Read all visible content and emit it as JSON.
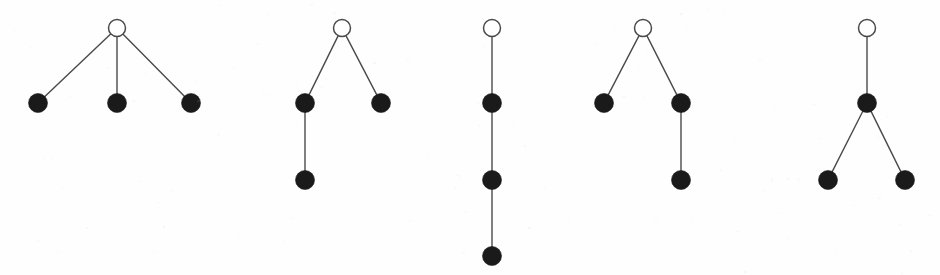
{
  "figure": {
    "background_color": "#fefefe",
    "width": 940,
    "height": 275,
    "node_styles": {
      "root_label": "open-circle",
      "root_fill": "#ffffff",
      "root_stroke": "#4a4a4a",
      "root_radius": 8.5,
      "child_label": "filled-circle",
      "child_fill": "#1a1a1a",
      "child_radius": 9.5,
      "edge_color": "#4a4a4a",
      "edge_width": 1.4
    }
  },
  "chart_data": {
    "type": "diagram",
    "diagram_kind": "rooted-tree-graphs",
    "xlabel": "",
    "ylabel": "",
    "grid": false,
    "legend": "none",
    "trees": [
      {
        "name": "tree-1",
        "description": "star: root with three leaf children",
        "nodes": [
          {
            "id": "r",
            "x": 117,
            "y": 28,
            "type": "open",
            "depth": 0
          },
          {
            "id": "a",
            "x": 38,
            "y": 103,
            "type": "filled",
            "depth": 1
          },
          {
            "id": "b",
            "x": 117,
            "y": 103,
            "type": "filled",
            "depth": 1
          },
          {
            "id": "c",
            "x": 191,
            "y": 103,
            "type": "filled",
            "depth": 1
          }
        ],
        "edges": [
          [
            "r",
            "a"
          ],
          [
            "r",
            "b"
          ],
          [
            "r",
            "c"
          ]
        ]
      },
      {
        "name": "tree-2",
        "description": "root with two children; left child has one child",
        "nodes": [
          {
            "id": "r",
            "x": 342,
            "y": 28,
            "type": "open",
            "depth": 0
          },
          {
            "id": "a",
            "x": 305,
            "y": 103,
            "type": "filled",
            "depth": 1
          },
          {
            "id": "b",
            "x": 381,
            "y": 103,
            "type": "filled",
            "depth": 1
          },
          {
            "id": "c",
            "x": 305,
            "y": 180,
            "type": "filled",
            "depth": 2
          }
        ],
        "edges": [
          [
            "r",
            "a"
          ],
          [
            "r",
            "b"
          ],
          [
            "a",
            "c"
          ]
        ]
      },
      {
        "name": "tree-3",
        "description": "path: root with a chain of three descendants",
        "nodes": [
          {
            "id": "r",
            "x": 492,
            "y": 28,
            "type": "open",
            "depth": 0
          },
          {
            "id": "a",
            "x": 492,
            "y": 103,
            "type": "filled",
            "depth": 1
          },
          {
            "id": "b",
            "x": 492,
            "y": 180,
            "type": "filled",
            "depth": 2
          },
          {
            "id": "c",
            "x": 492,
            "y": 256,
            "type": "filled",
            "depth": 3
          }
        ],
        "edges": [
          [
            "r",
            "a"
          ],
          [
            "a",
            "b"
          ],
          [
            "b",
            "c"
          ]
        ]
      },
      {
        "name": "tree-4",
        "description": "root with two children; right child has one child",
        "nodes": [
          {
            "id": "r",
            "x": 643,
            "y": 28,
            "type": "open",
            "depth": 0
          },
          {
            "id": "a",
            "x": 604,
            "y": 103,
            "type": "filled",
            "depth": 1
          },
          {
            "id": "b",
            "x": 681,
            "y": 103,
            "type": "filled",
            "depth": 1
          },
          {
            "id": "c",
            "x": 681,
            "y": 180,
            "type": "filled",
            "depth": 2
          }
        ],
        "edges": [
          [
            "r",
            "a"
          ],
          [
            "r",
            "b"
          ],
          [
            "b",
            "c"
          ]
        ]
      },
      {
        "name": "tree-5",
        "description": "root with one child; that child has two children",
        "nodes": [
          {
            "id": "r",
            "x": 867,
            "y": 28,
            "type": "open",
            "depth": 0
          },
          {
            "id": "a",
            "x": 867,
            "y": 103,
            "type": "filled",
            "depth": 1
          },
          {
            "id": "b",
            "x": 828,
            "y": 180,
            "type": "filled",
            "depth": 2
          },
          {
            "id": "c",
            "x": 905,
            "y": 180,
            "type": "filled",
            "depth": 2
          }
        ],
        "edges": [
          [
            "r",
            "a"
          ],
          [
            "a",
            "b"
          ],
          [
            "a",
            "c"
          ]
        ]
      }
    ]
  }
}
